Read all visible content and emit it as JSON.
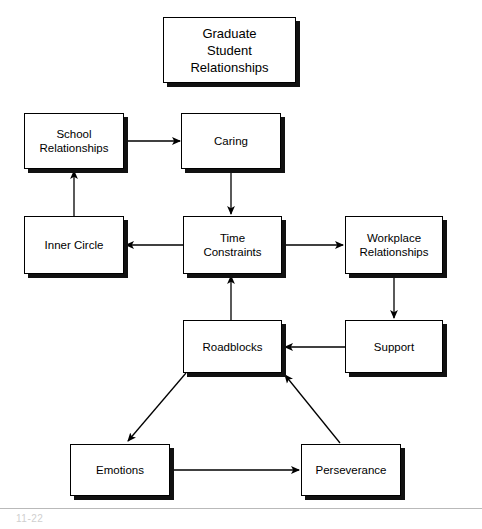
{
  "diagram": {
    "title": "Graduate Student Relationships",
    "nodes": [
      {
        "id": "title",
        "label": "Graduate\nStudent\nRelationships",
        "x": 163,
        "y": 17,
        "w": 133,
        "h": 66
      },
      {
        "id": "school",
        "label": "School\nRelationships",
        "x": 24,
        "y": 113,
        "w": 100,
        "h": 56
      },
      {
        "id": "caring",
        "label": "Caring",
        "x": 181,
        "y": 113,
        "w": 100,
        "h": 56
      },
      {
        "id": "inner",
        "label": "Inner Circle",
        "x": 24,
        "y": 216,
        "w": 100,
        "h": 58
      },
      {
        "id": "time",
        "label": "Time\nConstraints",
        "x": 183,
        "y": 216,
        "w": 99,
        "h": 58
      },
      {
        "id": "workplace",
        "label": "Workplace\nRelationships",
        "x": 345,
        "y": 216,
        "w": 98,
        "h": 58
      },
      {
        "id": "roadblocks",
        "label": "Roadblocks",
        "x": 183,
        "y": 320,
        "w": 99,
        "h": 53
      },
      {
        "id": "support",
        "label": "Support",
        "x": 345,
        "y": 320,
        "w": 98,
        "h": 53
      },
      {
        "id": "emotions",
        "label": "Emotions",
        "x": 70,
        "y": 444,
        "w": 100,
        "h": 52
      },
      {
        "id": "persever",
        "label": "Perseverance",
        "x": 301,
        "y": 444,
        "w": 100,
        "h": 52
      }
    ],
    "edges": [
      {
        "id": "school-to-caring",
        "from": "school",
        "to": "caring",
        "kind": "horizontal-right"
      },
      {
        "id": "caring-to-time",
        "from": "caring",
        "to": "time",
        "kind": "vertical-down"
      },
      {
        "id": "inner-to-school",
        "from": "inner",
        "to": "school",
        "kind": "vertical-up"
      },
      {
        "id": "time-to-inner",
        "from": "time",
        "to": "inner",
        "kind": "horizontal-left"
      },
      {
        "id": "time-to-workplace",
        "from": "time",
        "to": "workplace",
        "kind": "horizontal-right"
      },
      {
        "id": "workplace-to-support",
        "from": "workplace",
        "to": "support",
        "kind": "vertical-down"
      },
      {
        "id": "support-to-roadblocks",
        "from": "support",
        "to": "roadblocks",
        "kind": "horizontal-left"
      },
      {
        "id": "roadblocks-to-time",
        "from": "roadblocks",
        "to": "time",
        "kind": "vertical-up"
      },
      {
        "id": "roadblocks-to-emotions",
        "from": "roadblocks",
        "to": "emotions",
        "kind": "diagonal-down-left"
      },
      {
        "id": "emotions-to-persever",
        "from": "emotions",
        "to": "persever",
        "kind": "horizontal-right"
      },
      {
        "id": "persever-to-roadblocks",
        "from": "persever",
        "to": "roadblocks",
        "kind": "diagonal-up-left"
      }
    ]
  },
  "footer": {
    "note": "11-22"
  },
  "colors": {
    "line": "#000000",
    "box_fill": "#ffffff",
    "shadow": "#111111",
    "rule": "#b9b9b9",
    "footer_text": "#cfcfcf"
  }
}
